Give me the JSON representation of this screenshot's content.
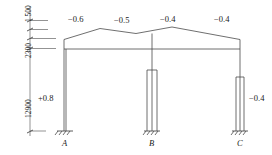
{
  "diagram": {
    "type": "structural-frame-load-coefficient-diagram",
    "roof_coefficients": [
      {
        "id": "left-windward",
        "value": "−0.6"
      },
      {
        "id": "left-leeward",
        "value": "−0.5"
      },
      {
        "id": "right-windward",
        "value": "−0.4"
      },
      {
        "id": "right-leeward",
        "value": "−0.4"
      }
    ],
    "wall_coefficients": [
      {
        "id": "left-wall",
        "value": "+0.8"
      },
      {
        "id": "right-wall",
        "value": "−0.4"
      }
    ],
    "dimensions": [
      {
        "id": "top-segment",
        "value": "1 500"
      },
      {
        "id": "mid-segment",
        "value": "2300"
      },
      {
        "id": "column-height",
        "value": "12900"
      }
    ],
    "supports": [
      {
        "id": "support-a",
        "label": "A"
      },
      {
        "id": "support-b",
        "label": "B"
      },
      {
        "id": "support-c",
        "label": "C"
      }
    ],
    "colors": {
      "line": "#4a4a4a",
      "text": "#1a1a1a",
      "background": "#ffffff"
    }
  }
}
